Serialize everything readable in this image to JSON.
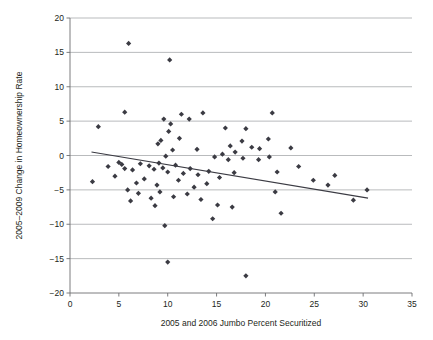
{
  "chart_data": {
    "type": "scatter",
    "title": "",
    "xlabel": "2005 and 2006 Jumbo Percent Securitized",
    "ylabel": "2005–2009 Change in Homeownership Rate",
    "xlim": [
      0,
      35
    ],
    "ylim": [
      -20,
      20
    ],
    "xticks": [
      0,
      5,
      10,
      15,
      20,
      25,
      30,
      35
    ],
    "yticks": [
      -20,
      -15,
      -10,
      -5,
      0,
      5,
      10,
      15,
      20
    ],
    "xtick_labels": [
      "0",
      "5",
      "10",
      "15",
      "20",
      "25",
      "30",
      "35"
    ],
    "ytick_labels": [
      "−20",
      "−15",
      "−10",
      "−5",
      "0",
      "5",
      "10",
      "15",
      "20"
    ],
    "grid": "horizontal",
    "legend": "none",
    "marker": "diamond",
    "marker_color": "#3b3b43",
    "marker_size": 4,
    "points": [
      [
        6.0,
        16.3
      ],
      [
        10.2,
        13.9
      ],
      [
        5.6,
        6.3
      ],
      [
        9.6,
        5.3
      ],
      [
        10.3,
        4.6
      ],
      [
        11.4,
        6.0
      ],
      [
        12.2,
        5.3
      ],
      [
        20.7,
        6.2
      ],
      [
        2.9,
        4.2
      ],
      [
        13.6,
        6.2
      ],
      [
        9.3,
        2.2
      ],
      [
        10.1,
        3.5
      ],
      [
        11.2,
        2.5
      ],
      [
        15.9,
        4.0
      ],
      [
        18.0,
        3.9
      ],
      [
        20.3,
        2.4
      ],
      [
        9.0,
        1.7
      ],
      [
        10.5,
        0.8
      ],
      [
        13.0,
        0.9
      ],
      [
        16.4,
        1.4
      ],
      [
        17.6,
        2.1
      ],
      [
        19.4,
        1.0
      ],
      [
        16.9,
        0.5
      ],
      [
        15.6,
        0.2
      ],
      [
        18.6,
        1.2
      ],
      [
        22.6,
        1.1
      ],
      [
        9.8,
        -0.1
      ],
      [
        14.8,
        -0.2
      ],
      [
        16.2,
        -0.6
      ],
      [
        17.7,
        -0.4
      ],
      [
        19.3,
        -0.6
      ],
      [
        3.9,
        -1.6
      ],
      [
        5.0,
        -1.0
      ],
      [
        5.3,
        -1.3
      ],
      [
        5.6,
        -1.9
      ],
      [
        6.4,
        -2.1
      ],
      [
        7.2,
        -1.2
      ],
      [
        8.1,
        -1.5
      ],
      [
        8.6,
        -2.0
      ],
      [
        9.1,
        -1.1
      ],
      [
        9.5,
        -1.8
      ],
      [
        10.0,
        -2.4
      ],
      [
        10.8,
        -1.4
      ],
      [
        11.6,
        -2.6
      ],
      [
        12.3,
        -1.9
      ],
      [
        13.1,
        -2.8
      ],
      [
        14.2,
        -2.3
      ],
      [
        15.3,
        -3.2
      ],
      [
        16.8,
        -2.5
      ],
      [
        2.3,
        -3.8
      ],
      [
        4.6,
        -3.0
      ],
      [
        6.8,
        -4.0
      ],
      [
        7.6,
        -3.4
      ],
      [
        8.9,
        -4.3
      ],
      [
        11.1,
        -3.6
      ],
      [
        12.7,
        -4.6
      ],
      [
        14.0,
        -4.1
      ],
      [
        5.9,
        -5.0
      ],
      [
        7.0,
        -5.5
      ],
      [
        8.3,
        -6.2
      ],
      [
        9.2,
        -5.3
      ],
      [
        10.6,
        -6.0
      ],
      [
        12.0,
        -5.6
      ],
      [
        13.4,
        -6.4
      ],
      [
        15.1,
        -7.2
      ],
      [
        16.6,
        -7.5
      ],
      [
        8.7,
        -7.3
      ],
      [
        6.2,
        -6.6
      ],
      [
        14.6,
        -9.2
      ],
      [
        9.7,
        -10.2
      ],
      [
        10.0,
        -15.5
      ],
      [
        18.0,
        -17.5
      ],
      [
        20.4,
        -0.2
      ],
      [
        21.2,
        -2.4
      ],
      [
        21.0,
        -5.3
      ],
      [
        23.4,
        -1.6
      ],
      [
        24.9,
        -3.6
      ],
      [
        21.6,
        -8.4
      ],
      [
        26.4,
        -4.3
      ],
      [
        27.1,
        -2.9
      ],
      [
        30.4,
        -5.0
      ],
      [
        29.0,
        -6.5
      ]
    ],
    "trendline": {
      "x": [
        2.2,
        30.5
      ],
      "y": [
        0.5,
        -6.2
      ],
      "color": "#3b3b43"
    }
  }
}
